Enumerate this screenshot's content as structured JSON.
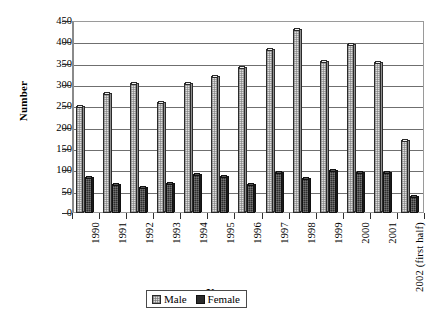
{
  "chart_data": {
    "type": "bar",
    "title": "",
    "subtitle": "",
    "xlabel": "Year",
    "ylabel": "Number",
    "ylim": [
      0,
      450
    ],
    "ytick_step": 50,
    "yticks": [
      450,
      400,
      350,
      300,
      250,
      200,
      150,
      100,
      50,
      0
    ],
    "ytick_labels": [
      "450",
      "400",
      "350",
      "300",
      "250",
      "200",
      "150",
      "100",
      "50",
      "0"
    ],
    "grid": true,
    "grid_axis": "y",
    "legend_position": "bottom-center",
    "categories": [
      "1990",
      "1991",
      "1992",
      "1993",
      "1994",
      "1995",
      "1996",
      "1997",
      "1998",
      "1999",
      "2000",
      "2001",
      "2002 (first half)"
    ],
    "series": [
      {
        "name": "Male",
        "color": "#dedede",
        "values": [
          250,
          282,
          305,
          260,
          305,
          320,
          343,
          385,
          432,
          357,
          397,
          355,
          170
        ]
      },
      {
        "name": "Female",
        "color": "#2e2e2e",
        "values": [
          85,
          67,
          62,
          70,
          92,
          87,
          68,
          97,
          82,
          100,
          97,
          97,
          40
        ]
      }
    ]
  },
  "legend": {
    "entries": [
      {
        "label": "Male",
        "swatch": "male-swatch"
      },
      {
        "label": "Female",
        "swatch": "female-swatch"
      }
    ]
  }
}
